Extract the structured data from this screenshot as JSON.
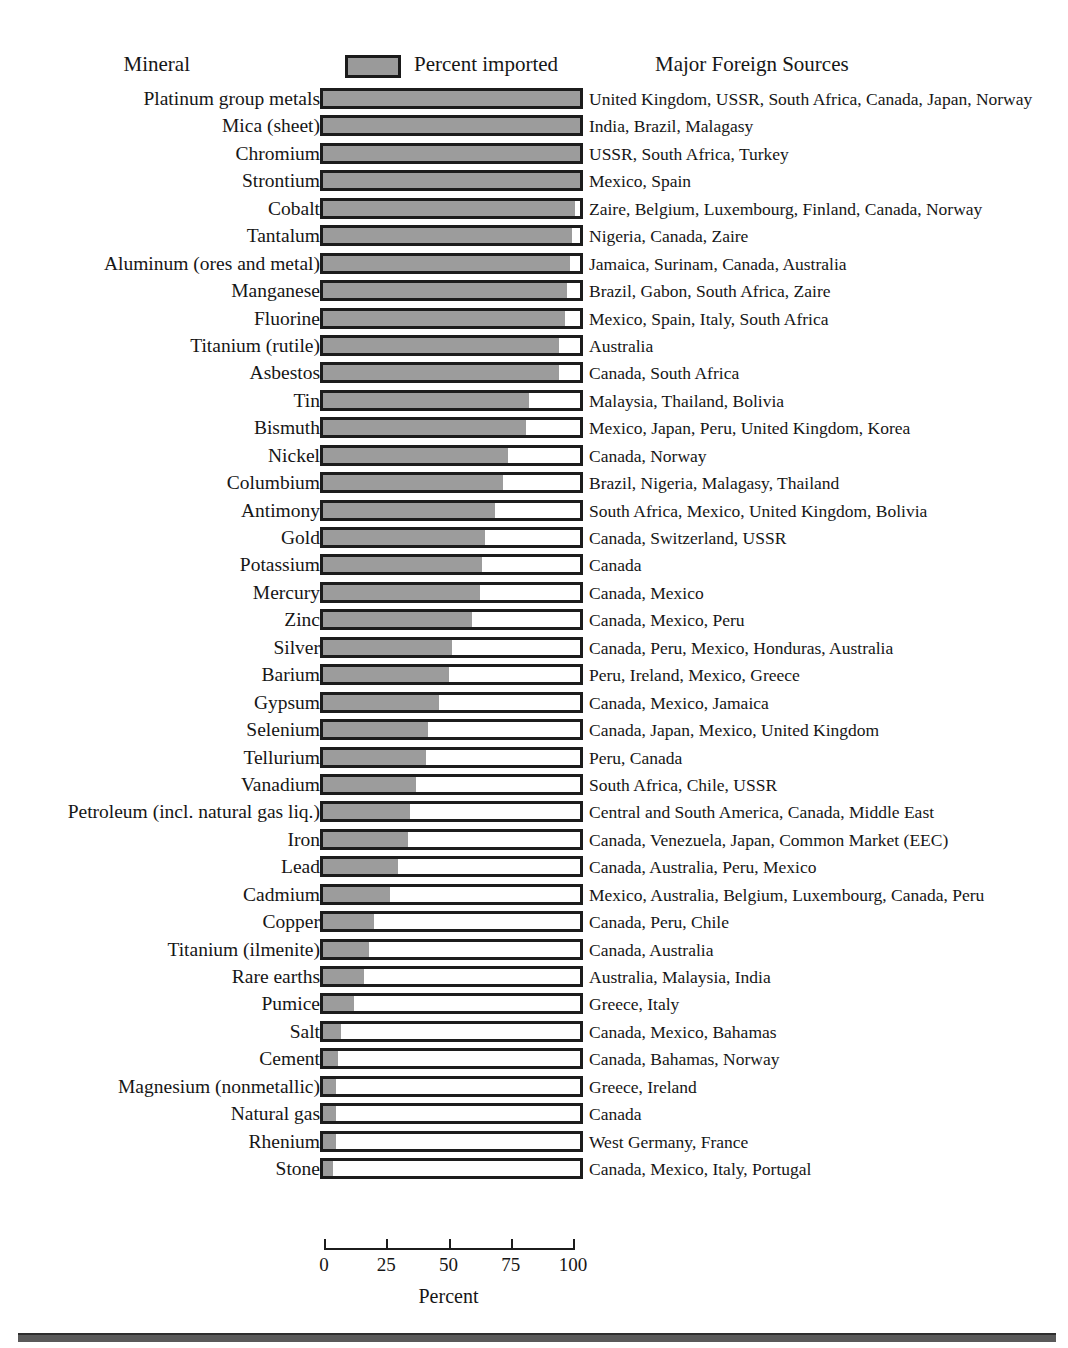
{
  "header": {
    "mineral_label": "Mineral",
    "legend_label": "Percent imported",
    "sources_label": "Major Foreign Sources"
  },
  "axis": {
    "title": "Percent",
    "ticks": [
      "0",
      "25",
      "50",
      "75",
      "100"
    ]
  },
  "colors": {
    "bar_fill": "#9c9c9c",
    "bar_border": "#1c1c1c",
    "background": "#ffffff",
    "text": "#161616",
    "bottom_rule": "#5a5a5a"
  },
  "chart_data": {
    "type": "bar",
    "title": "",
    "xlabel": "Percent",
    "ylabel": "Mineral",
    "xlim": [
      0,
      100
    ],
    "grid": false,
    "orientation": "horizontal",
    "legend": [
      "Percent imported"
    ],
    "legend_position": "top-center",
    "extra_column_header": "Major Foreign Sources",
    "categories": [
      "Platinum group metals",
      "Mica (sheet)",
      "Chromium",
      "Strontium",
      "Cobalt",
      "Tantalum",
      "Aluminum (ores and metal)",
      "Manganese",
      "Fluorine",
      "Titanium (rutile)",
      "Asbestos",
      "Tin",
      "Bismuth",
      "Nickel",
      "Columbium",
      "Antimony",
      "Gold",
      "Potassium",
      "Mercury",
      "Zinc",
      "Silver",
      "Barium",
      "Gypsum",
      "Selenium",
      "Tellurium",
      "Vanadium",
      "Petroleum (incl. natural gas liq.)",
      "Iron",
      "Lead",
      "Cadmium",
      "Copper",
      "Titanium (ilmenite)",
      "Rare earths",
      "Pumice",
      "Salt",
      "Cement",
      "Magnesium (nonmetallic)",
      "Natural gas",
      "Rhenium",
      "Stone"
    ],
    "values": [
      100,
      100,
      100,
      100,
      98,
      97,
      96,
      95,
      94,
      92,
      92,
      80,
      79,
      72,
      70,
      67,
      63,
      62,
      61,
      58,
      50,
      49,
      45,
      41,
      40,
      36,
      34,
      33,
      29,
      26,
      20,
      18,
      16,
      12,
      7,
      6,
      5,
      5,
      5,
      4
    ],
    "sources": [
      "United Kingdom, USSR, South Africa, Canada, Japan, Norway",
      "India, Brazil, Malagasy",
      "USSR, South Africa, Turkey",
      "Mexico, Spain",
      "Zaire, Belgium, Luxembourg, Finland, Canada, Norway",
      "Nigeria, Canada, Zaire",
      "Jamaica, Surinam, Canada, Australia",
      "Brazil, Gabon, South Africa, Zaire",
      "Mexico, Spain, Italy, South Africa",
      "Australia",
      "Canada, South Africa",
      "Malaysia, Thailand, Bolivia",
      "Mexico, Japan, Peru, United Kingdom, Korea",
      "Canada, Norway",
      "Brazil, Nigeria, Malagasy, Thailand",
      "South Africa, Mexico, United Kingdom, Bolivia",
      "Canada, Switzerland, USSR",
      "Canada",
      "Canada, Mexico",
      "Canada, Mexico, Peru",
      "Canada, Peru, Mexico, Honduras, Australia",
      "Peru, Ireland, Mexico, Greece",
      "Canada, Mexico, Jamaica",
      "Canada, Japan, Mexico, United Kingdom",
      "Peru, Canada",
      "South Africa, Chile, USSR",
      "Central and South America, Canada, Middle East",
      "Canada, Venezuela, Japan, Common Market (EEC)",
      "Canada, Australia, Peru, Mexico",
      "Mexico, Australia, Belgium, Luxembourg, Canada, Peru",
      "Canada, Peru, Chile",
      "Canada, Australia",
      "Australia, Malaysia, India",
      "Greece, Italy",
      "Canada, Mexico, Bahamas",
      "Canada, Bahamas, Norway",
      "Greece, Ireland",
      "Canada",
      "West Germany, France",
      "Canada, Mexico, Italy, Portugal"
    ]
  }
}
